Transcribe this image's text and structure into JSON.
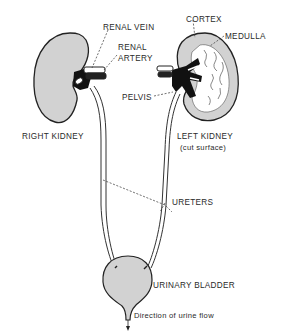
{
  "diagram": {
    "labels": {
      "renal_vein": "RENAL VEIN",
      "renal_artery_line1": "RENAL",
      "renal_artery_line2": "ARTERY",
      "cortex": "CORTEX",
      "medulla": "MEDULLA",
      "pelvis": "PELVIS",
      "right_kidney": "RIGHT KIDNEY",
      "left_kidney": "LEFT KIDNEY",
      "left_kidney_note": "(cut surface)",
      "ureters": "URETERS",
      "urinary_bladder": "URINARY BLADDER",
      "flow": "Direction of urine flow"
    },
    "colors": {
      "organ_fill": "#d2d2d2",
      "outline": "#222222",
      "vessel": "#111111",
      "background": "#ffffff"
    }
  }
}
